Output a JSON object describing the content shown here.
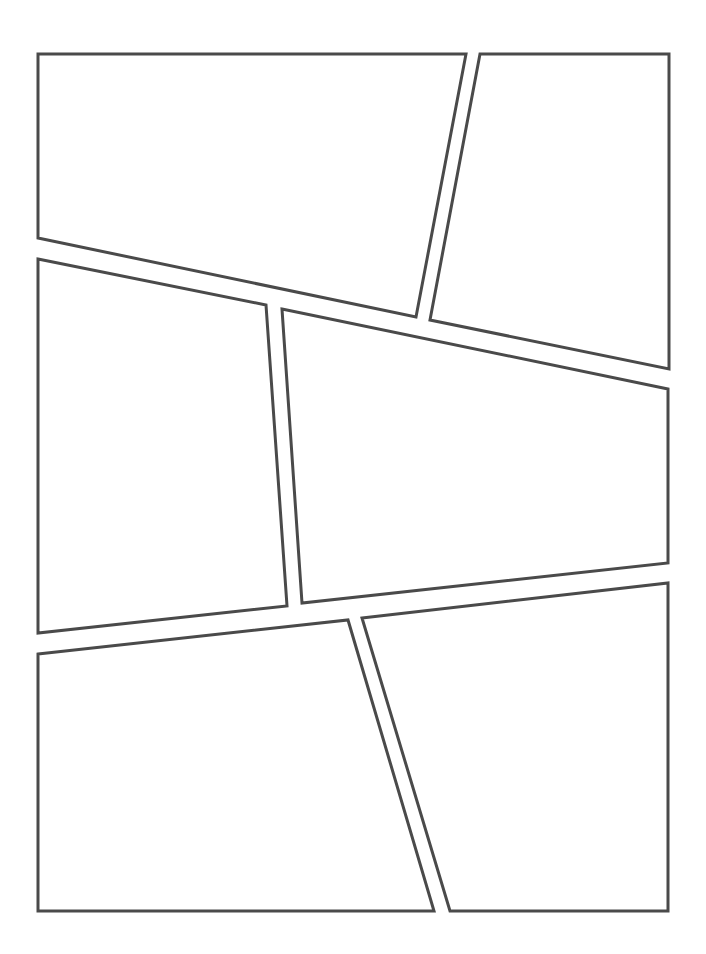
{
  "page": {
    "width": 706,
    "height": 954,
    "background": "#ffffff"
  },
  "style": {
    "stroke_color": "#4a4a4a",
    "stroke_width": 3,
    "panel_fill": "#ffffff"
  },
  "panels": [
    {
      "id": "panel-1",
      "position": "top-left",
      "points": [
        [
          38,
          54
        ],
        [
          466,
          54
        ],
        [
          416,
          317
        ],
        [
          38,
          238
        ]
      ]
    },
    {
      "id": "panel-2",
      "position": "top-right",
      "points": [
        [
          480,
          54
        ],
        [
          669,
          54
        ],
        [
          669,
          369
        ],
        [
          430,
          320
        ]
      ]
    },
    {
      "id": "panel-3",
      "position": "middle-left",
      "points": [
        [
          38,
          259
        ],
        [
          266,
          305
        ],
        [
          287,
          606
        ],
        [
          38,
          633
        ]
      ]
    },
    {
      "id": "panel-4",
      "position": "middle-right",
      "points": [
        [
          282,
          309
        ],
        [
          668,
          389
        ],
        [
          668,
          563
        ],
        [
          302,
          603
        ]
      ]
    },
    {
      "id": "panel-5",
      "position": "bottom-left",
      "points": [
        [
          38,
          654
        ],
        [
          348,
          620
        ],
        [
          434,
          911
        ],
        [
          38,
          911
        ]
      ]
    },
    {
      "id": "panel-6",
      "position": "bottom-right",
      "points": [
        [
          362,
          618
        ],
        [
          668,
          583
        ],
        [
          668,
          911
        ],
        [
          450,
          911
        ]
      ]
    }
  ]
}
